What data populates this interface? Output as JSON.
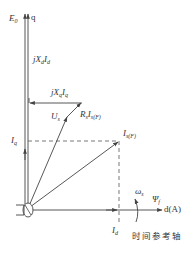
{
  "diagram": {
    "type": "phasor-diagram",
    "axes": {
      "q_axis_label": "q",
      "d_axis_label": "d(A)",
      "time_reference_axis": "时间参考轴",
      "rotation_label": "ω",
      "rotation_sub": "s",
      "flux_label": "Ψ",
      "flux_sub": "f"
    },
    "phasors": {
      "E0": {
        "main": "E",
        "sub": "0"
      },
      "jXdId": {
        "main": "jX",
        "sub1": "d",
        "main2": "I",
        "sub2": "d"
      },
      "jXqIq": {
        "main": "jX",
        "sub1": "q",
        "main2": "I",
        "sub2": "q"
      },
      "Us": {
        "main": "U",
        "sub": "s"
      },
      "RsIs": {
        "main": "R",
        "sub1": "s",
        "main2": "I",
        "sub2": "s(F)"
      },
      "Is": {
        "main": "I",
        "sub": "s(F)"
      },
      "Iq": {
        "main": "I",
        "sub": "q"
      },
      "Id": {
        "main": "I",
        "sub": "d"
      }
    },
    "colors": {
      "line": "#444444",
      "dashed": "#555555",
      "text": "#333333"
    }
  }
}
